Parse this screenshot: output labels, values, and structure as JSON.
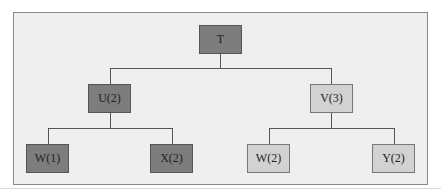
{
  "diagram": {
    "type": "tree",
    "nodes": [
      {
        "id": "T",
        "label": "T",
        "shade": "dark",
        "parent": null
      },
      {
        "id": "U",
        "label": "U(2)",
        "shade": "dark",
        "parent": "T"
      },
      {
        "id": "V",
        "label": "V(3)",
        "shade": "light",
        "parent": "T"
      },
      {
        "id": "W1",
        "label": "W(1)",
        "shade": "dark",
        "parent": "U"
      },
      {
        "id": "X",
        "label": "X(2)",
        "shade": "dark",
        "parent": "U"
      },
      {
        "id": "W2",
        "label": "W(2)",
        "shade": "light",
        "parent": "V"
      },
      {
        "id": "Y",
        "label": "Y(2)",
        "shade": "light",
        "parent": "V"
      }
    ],
    "colors": {
      "dark": "#7d7d7d",
      "light": "#d2d2d2",
      "background": "#efefef",
      "line": "#555555"
    }
  }
}
